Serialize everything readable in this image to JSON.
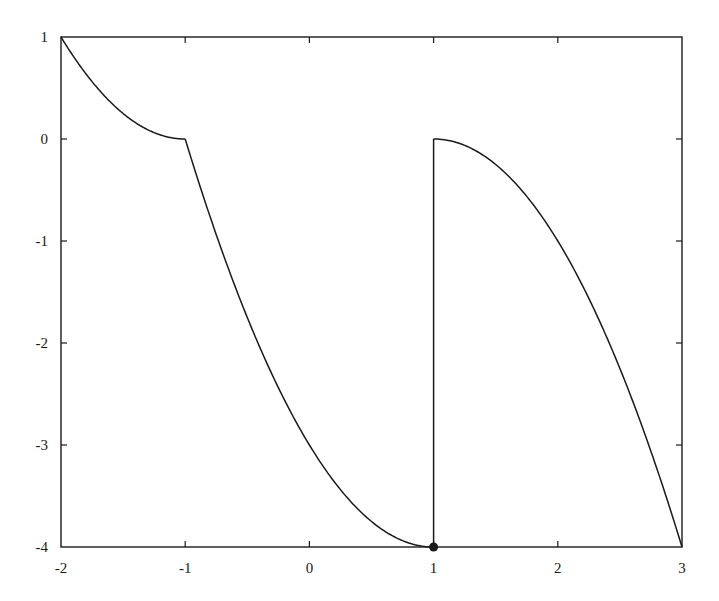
{
  "chart_data": {
    "type": "line",
    "title": "",
    "xlabel": "",
    "ylabel": "",
    "xlim": [
      -2,
      3
    ],
    "ylim": [
      -4,
      1
    ],
    "grid": false,
    "legend": null,
    "x_ticks": [
      -2,
      -1,
      0,
      1,
      2,
      3
    ],
    "x_tick_labels": [
      "-2",
      "-1",
      "0",
      "1",
      "2",
      "3"
    ],
    "y_ticks": [
      1,
      0,
      -1,
      -2,
      -3,
      -4
    ],
    "y_tick_labels": [
      "1",
      "0",
      "-1",
      "-2",
      "-3",
      "-4"
    ],
    "series": [
      {
        "name": "piece-1",
        "formula": "(x+1)^2",
        "domain": [
          -2,
          -1
        ],
        "x": [
          -2,
          -1.75,
          -1.5,
          -1.25,
          -1
        ],
        "y": [
          1,
          0.5625,
          0.25,
          0.0625,
          0
        ]
      },
      {
        "name": "piece-2",
        "formula": "(x-1)^2 - 4",
        "domain": [
          -1,
          1
        ],
        "x": [
          -1,
          -0.5,
          0,
          0.5,
          1
        ],
        "y": [
          0,
          -1.75,
          -3,
          -3.75,
          -4
        ]
      },
      {
        "name": "jump",
        "formula": "vertical segment at x=1",
        "x": [
          1,
          1
        ],
        "y": [
          -4,
          0
        ]
      },
      {
        "name": "piece-3",
        "formula": "-(x-1)^2",
        "domain": [
          1,
          3
        ],
        "x": [
          1,
          1.5,
          2,
          2.5,
          3
        ],
        "y": [
          0,
          -0.25,
          -1,
          -2.25,
          -4
        ]
      }
    ],
    "annotations": [
      {
        "type": "filled-point",
        "x": 1,
        "y": -4
      }
    ],
    "colors": {
      "line": "#1a1a1a",
      "axis": "#1a1a1a",
      "background": "#ffffff"
    }
  }
}
